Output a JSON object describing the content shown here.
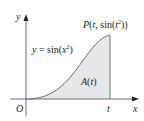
{
  "figure": {
    "axes": {
      "x_label": "x",
      "y_label": "y",
      "origin_label": "O",
      "t_tick_label": "t"
    },
    "curve": {
      "equation_prefix": "y = sin(x",
      "equation_exp": "2",
      "equation_suffix": ")",
      "function": "sin(x^2)"
    },
    "point": {
      "prefix": "P(t, sin(t",
      "exp": "2",
      "suffix": "))"
    },
    "area": {
      "label": "A(t)"
    },
    "colors": {
      "fill": "#e6e7e8",
      "stroke": "#6d6e71",
      "axis": "#6d6e71",
      "text": "#231f20"
    }
  }
}
